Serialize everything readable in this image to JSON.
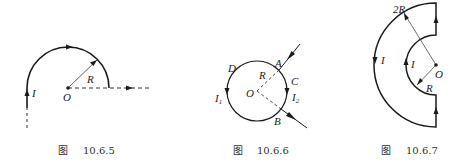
{
  "figures": [
    {
      "id": "fig-10-6-5",
      "caption_prefix": "图",
      "caption_number": "10.6.5",
      "labels": {
        "current": "I",
        "radius": "R",
        "center": "O"
      }
    },
    {
      "id": "fig-10-6-6",
      "caption_prefix": "图",
      "caption_number": "10.6.6",
      "labels": {
        "point_a": "A",
        "point_b": "B",
        "point_c": "C",
        "point_d": "D",
        "radius": "R",
        "center": "O",
        "current_1": "I",
        "current_1_sub": "1",
        "current_2": "I",
        "current_2_sub": "2"
      }
    },
    {
      "id": "fig-10-6-7",
      "caption_prefix": "图",
      "caption_number": "10.6.7",
      "labels": {
        "outer_radius": "2R",
        "inner_radius": "R",
        "center": "O",
        "outer_current": "I",
        "inner_current": "I"
      }
    }
  ],
  "colors": {
    "stroke": "#1a1a1a",
    "thin_stroke": "#333333",
    "background": "#ffffff"
  }
}
